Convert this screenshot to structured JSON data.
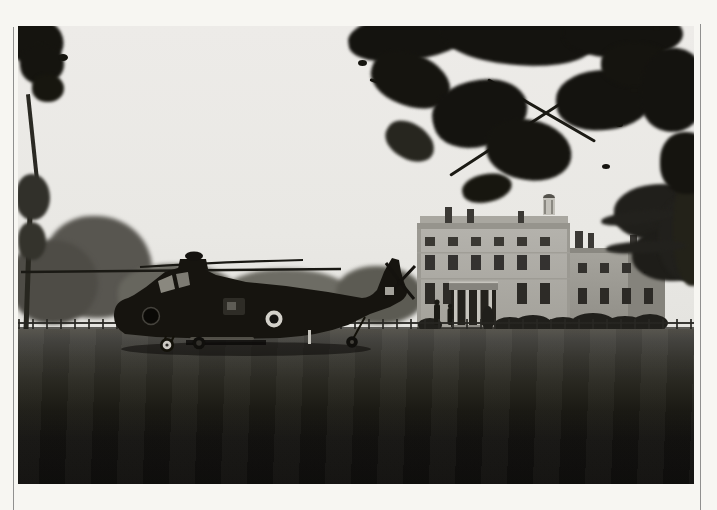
{
  "image": {
    "type": "photograph",
    "alt": "Black-and-white photograph: a dark military Wessex-style helicopter with an RAF roundel parked on a large lawn in front of a three-storey Georgian country house, framed by overhanging tree branches, printed with a white border and thin keylines",
    "border_style": "white print border with thin vertical keylines at left and right"
  },
  "scene": {
    "sky": {
      "description": "pale overcast sky",
      "color": "#e9e8e4"
    },
    "overhanging_tree": {
      "description": "dark leafy branches hanging over the top right and top left corners",
      "color": "#14130f"
    },
    "background_trees": {
      "description": "soft grey treeline behind the helicopter",
      "color": "#67665e"
    },
    "house": {
      "description": "Georgian mansion with parapet roof, chimneys, roof lantern, columned portico and a lower right wing",
      "wall_color": "#b2b0aa",
      "window_color": "#34322e",
      "portico_column_color": "#c6c4bd"
    },
    "cedar_tree": {
      "description": "dark cedar beside the right end of the house",
      "color": "#201f1b"
    },
    "fence": {
      "description": "low estate fence running across the lawn",
      "color": "#2b2a26"
    },
    "lawn": {
      "description": "large lawn, light in midground shading to near-black in foreground",
      "foreground_color": "#0f0e0c"
    },
    "helicopter": {
      "description": "Wessex-type helicopter, side view facing left, drooping main rotor blades, tail rotor at right",
      "body_color": "#16140f",
      "roundel": {
        "description": "RAF roundel on fuselage",
        "ring_color": "#d3d1ca",
        "centre_color": "#131210"
      },
      "wheel_sidewall_color": "#ccc9c2"
    },
    "figures": {
      "description": "two small standing figures near the portico",
      "color": "#1b1a15"
    }
  },
  "palette": {
    "border_white": "#f7f6f2",
    "keyline": "#6e6e6e",
    "foliage_dark": "#14130f",
    "grass_mid": "#454440",
    "grass_dark": "#0f0e0c"
  }
}
